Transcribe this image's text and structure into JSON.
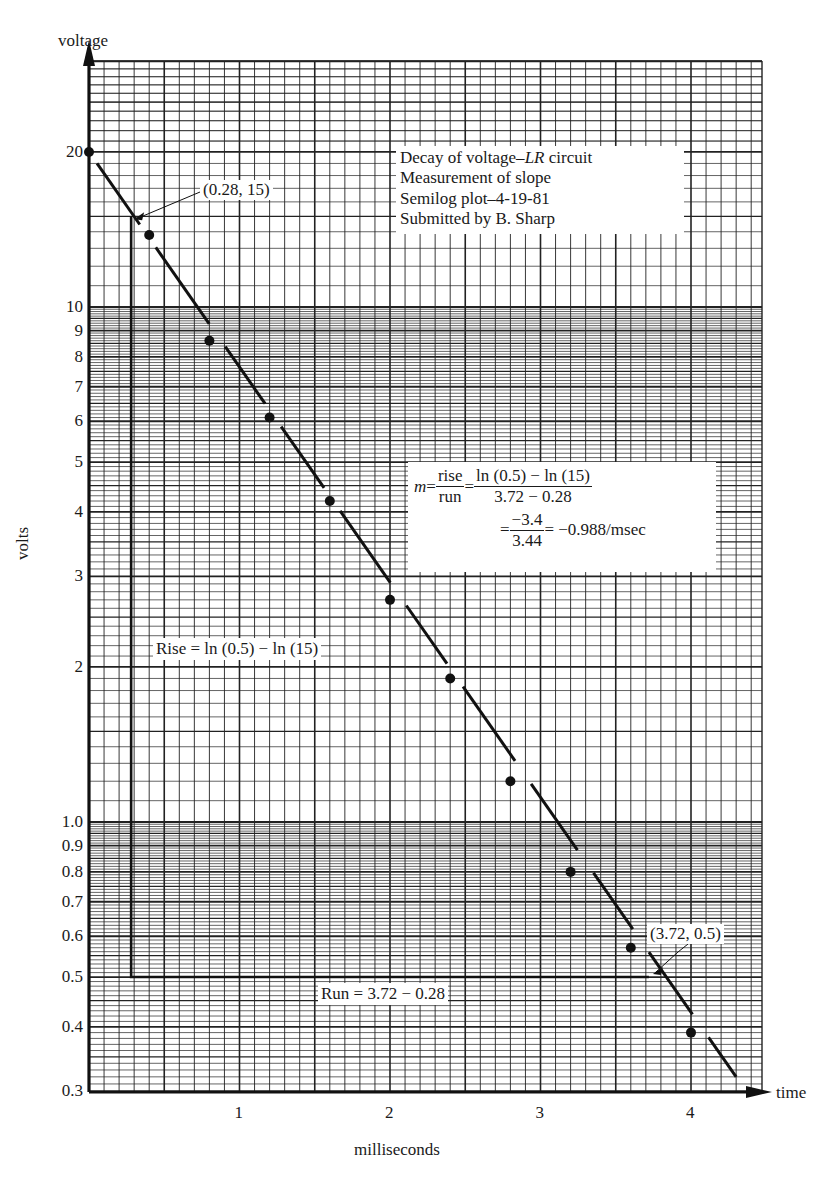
{
  "chart_data": {
    "type": "scatter",
    "title": "Decay of voltage–LR circuit",
    "xlabel": "milliseconds",
    "ylabel": "volts",
    "x_axis_end_label": "time",
    "y_axis_end_label": "voltage",
    "y_scale": "log",
    "xlim": [
      0,
      4.5
    ],
    "ylim": [
      0.3,
      30
    ],
    "grid": true,
    "x_ticks": [
      "1",
      "2",
      "3",
      "4"
    ],
    "y_ticks": [
      "0.3",
      "0.4",
      "0.5",
      "0.6",
      "0.7",
      "0.8",
      "0.9",
      "1.0",
      "2",
      "3",
      "4",
      "5",
      "6",
      "7",
      "8",
      "9",
      "10",
      "20"
    ],
    "series": [
      {
        "name": "measured voltage",
        "x": [
          0,
          0.4,
          0.8,
          1.2,
          1.6,
          2.0,
          2.4,
          2.8,
          3.2,
          3.6,
          4.0
        ],
        "y": [
          20,
          13.8,
          8.6,
          6.1,
          4.2,
          2.7,
          1.9,
          1.2,
          0.8,
          0.57,
          0.39
        ]
      },
      {
        "name": "fitted line",
        "type": "line",
        "x": [
          0,
          4.3
        ],
        "y": [
          20,
          0.32
        ]
      }
    ],
    "annotations": [
      {
        "text": "(0.28, 15)",
        "x": 0.28,
        "y": 15
      },
      {
        "text": "(3.72, 0.5)",
        "x": 3.72,
        "y": 0.5
      },
      {
        "text": "Rise = ln (0.5) − ln (15)"
      },
      {
        "text": "Run = 3.72 − 0.28"
      }
    ]
  },
  "labels": {
    "y_axis_top": "voltage",
    "y_axis_side": "volts",
    "x_axis_right": "time",
    "x_axis_bottom": "milliseconds",
    "point_a": "(0.28, 15)",
    "point_b": "(3.72, 0.5)",
    "rise": "Rise = ln (0.5) − ln (15)",
    "run": "Run = 3.72 − 0.28"
  },
  "title_block": {
    "line1_pre": "Decay of voltage–",
    "line1_italic": "LR",
    "line1_post": " circuit",
    "line2": "Measurement of slope",
    "line3": "Semilog plot–4-19-81",
    "line4": "Submitted by B. Sharp"
  },
  "slope_box": {
    "m": "m",
    "eq": " = ",
    "frac1_num": "rise",
    "frac1_den": "run",
    "frac2_num": "ln (0.5) − ln (15)",
    "frac2_den": "3.72 − 0.28",
    "frac3_num": "−3.4",
    "frac3_den": "3.44",
    "result": " = −0.988/msec"
  },
  "y_tick_labels": [
    {
      "text": "20",
      "v": 20
    },
    {
      "text": "10",
      "v": 10
    },
    {
      "text": "9",
      "v": 9
    },
    {
      "text": "8",
      "v": 8
    },
    {
      "text": "7",
      "v": 7
    },
    {
      "text": "6",
      "v": 6
    },
    {
      "text": "5",
      "v": 5
    },
    {
      "text": "4",
      "v": 4
    },
    {
      "text": "3",
      "v": 3
    },
    {
      "text": "2",
      "v": 2
    },
    {
      "text": "1.0",
      "v": 1.0
    },
    {
      "text": "0.9",
      "v": 0.9
    },
    {
      "text": "0.8",
      "v": 0.8
    },
    {
      "text": "0.7",
      "v": 0.7
    },
    {
      "text": "0.6",
      "v": 0.6
    },
    {
      "text": "0.5",
      "v": 0.5
    },
    {
      "text": "0.4",
      "v": 0.4
    },
    {
      "text": "0.3",
      "v": 0.3
    }
  ],
  "x_tick_labels": [
    {
      "text": "1",
      "v": 1
    },
    {
      "text": "2",
      "v": 2
    },
    {
      "text": "3",
      "v": 3
    },
    {
      "text": "4",
      "v": 4
    }
  ]
}
